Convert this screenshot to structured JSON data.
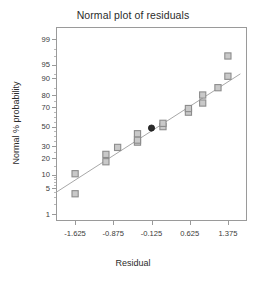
{
  "chart_data": {
    "type": "scatter",
    "title": "Normal plot of residuals",
    "xlabel": "Residual",
    "ylabel": "Normal % probability",
    "grid": false,
    "legend": null,
    "xlim": [
      -2.0,
      1.75
    ],
    "xticks": [
      -1.625,
      -0.875,
      -0.125,
      0.625,
      1.375
    ],
    "xtick_labels": [
      "-1.625",
      "-0.875",
      "-0.125",
      "0.625",
      "1.375"
    ],
    "yscale": "normal-probability",
    "ylim": [
      0.6,
      99.6
    ],
    "yticks": [
      1,
      5,
      10,
      20,
      30,
      50,
      70,
      80,
      90,
      95,
      99
    ],
    "ytick_labels": [
      "1",
      "5",
      "10",
      "20",
      "30",
      "50",
      "70",
      "80",
      "90",
      "95",
      "99"
    ],
    "series": [
      {
        "name": "residuals",
        "marker": "open-square",
        "marker_color": "#8c8c8c",
        "points": [
          {
            "x": -1.625,
            "y": 3.7
          },
          {
            "x": -1.625,
            "y": 10.5
          },
          {
            "x": -1.02,
            "y": 17.5
          },
          {
            "x": -1.02,
            "y": 23.0
          },
          {
            "x": -0.79,
            "y": 29.0
          },
          {
            "x": -0.4,
            "y": 34.0
          },
          {
            "x": -0.4,
            "y": 36.0
          },
          {
            "x": -0.4,
            "y": 42.5
          },
          {
            "x": 0.1,
            "y": 50.0
          },
          {
            "x": 0.1,
            "y": 53.5
          },
          {
            "x": 0.6,
            "y": 65.0
          },
          {
            "x": 0.6,
            "y": 68.5
          },
          {
            "x": 0.88,
            "y": 73.5
          },
          {
            "x": 0.88,
            "y": 80.0
          },
          {
            "x": 1.18,
            "y": 85.0
          },
          {
            "x": 1.375,
            "y": 91.0
          },
          {
            "x": 1.375,
            "y": 97.0
          }
        ]
      },
      {
        "name": "highlighted-residual",
        "marker": "filled-circle",
        "marker_color": "#2b2b2b",
        "points": [
          {
            "x": -0.125,
            "y": 48.5
          }
        ]
      }
    ],
    "reference_line": {
      "name": "normal-reference-line",
      "color": "#a8a8a8",
      "x": [
        -2.0,
        1.62
      ],
      "y": [
        4.0,
        92.0
      ]
    }
  }
}
